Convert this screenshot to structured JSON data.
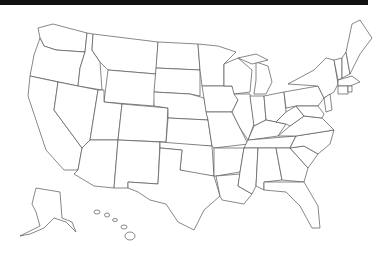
{
  "map": {
    "title": "",
    "type": "blank-outline",
    "region": "United States",
    "colors": {
      "stroke": "#555555",
      "fill": "#ffffff",
      "topbar": "#111111"
    },
    "insets": [
      "Alaska",
      "Hawaii"
    ]
  }
}
